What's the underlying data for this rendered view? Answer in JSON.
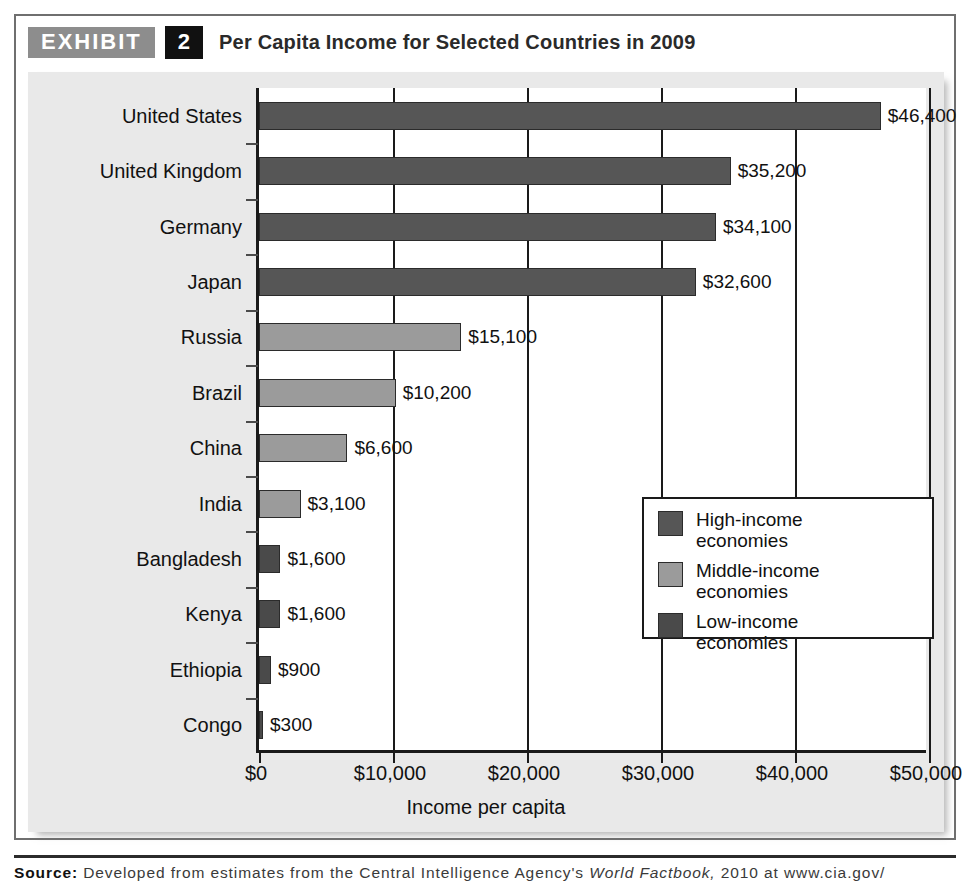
{
  "exhibit": {
    "tag": "EXHIBIT",
    "number": "2",
    "title": "Per Capita Income for Selected Countries in 2009"
  },
  "source": {
    "label": "Source:",
    "text_before_italic": " Developed from estimates from the Central Intelligence Agency's ",
    "italic": "World Factbook,",
    "text_after_italic": " 2010 at www.cia.gov/"
  },
  "legend": {
    "items": [
      {
        "label": "High-income\neconomies",
        "line1": "High-income",
        "line2": "economies",
        "key": "high",
        "color": "#565656"
      },
      {
        "label": "Middle-income\neconomies",
        "line1": "Middle-income",
        "line2": "economies",
        "key": "middle",
        "color": "#9b9b9b"
      },
      {
        "label": "Low-income\neconomies",
        "line1": "Low-income",
        "line2": "economies",
        "key": "low",
        "color": "#4a4a4a"
      }
    ]
  },
  "chart_data": {
    "type": "bar",
    "orientation": "horizontal",
    "title": "Per Capita Income for Selected Countries in 2009",
    "xlabel": "Income per capita",
    "ylabel": "",
    "xlim": [
      0,
      50000
    ],
    "xticks": [
      0,
      10000,
      20000,
      30000,
      40000,
      50000
    ],
    "xtick_labels": [
      "$0",
      "$10,000",
      "$20,000",
      "$30,000",
      "$40,000",
      "$50,000"
    ],
    "grid": true,
    "legend_position": "inside-right",
    "categories": [
      "United States",
      "United Kingdom",
      "Germany",
      "Japan",
      "Russia",
      "Brazil",
      "China",
      "India",
      "Bangladesh",
      "Kenya",
      "Ethiopia",
      "Congo"
    ],
    "values": [
      46400,
      35200,
      34100,
      32600,
      15100,
      10200,
      6600,
      3100,
      1600,
      1600,
      900,
      300
    ],
    "value_labels": [
      "$46,400",
      "$35,200",
      "$34,100",
      "$32,600",
      "$15,100",
      "$10,200",
      "$6,600",
      "$3,100",
      "$1,600",
      "$1,600",
      "$900",
      "$300"
    ],
    "groups": [
      "high",
      "high",
      "high",
      "high",
      "middle",
      "middle",
      "middle",
      "middle",
      "low",
      "low",
      "low",
      "low"
    ],
    "group_colors": {
      "high": "#565656",
      "middle": "#9b9b9b",
      "low": "#4a4a4a"
    }
  }
}
